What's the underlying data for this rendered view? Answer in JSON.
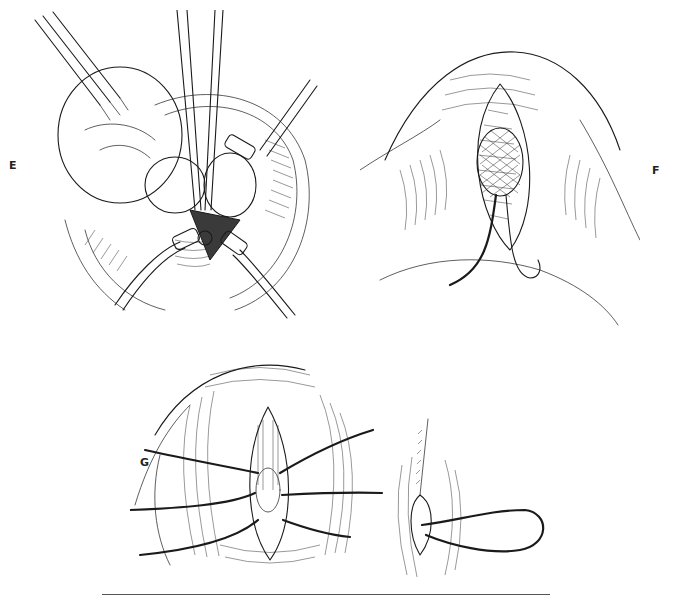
{
  "figure": {
    "panels": [
      {
        "id": "E",
        "label": "E",
        "description": "Surgical exposure with forceps retracting tissue, scissors at center, retractor clamps around incision"
      },
      {
        "id": "F",
        "label": "F",
        "description": "Elliptical incision with cross-hatched mesh patch and suture loop below"
      },
      {
        "id": "G",
        "label": "G",
        "description": "Layered closure with multiple sutures placed across incision, and final closed skin incision with running suture"
      }
    ],
    "caption_rule": true
  }
}
